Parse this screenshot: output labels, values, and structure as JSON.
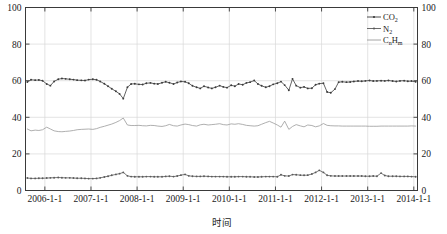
{
  "chart_data": {
    "type": "line",
    "title": "",
    "xlabel": "时间",
    "ylabel": "",
    "ylim": [
      0,
      100
    ],
    "yticks": [
      0,
      20,
      40,
      60,
      80,
      100
    ],
    "ytick_labels": [
      "0",
      "20",
      "40",
      "60",
      "80",
      "100"
    ],
    "right_axis": true,
    "right_ytick_labels": [
      "0",
      "20",
      "40",
      "60",
      "80",
      "100"
    ],
    "grid": true,
    "legend_position": "top-right",
    "xtick_labels": [
      "2006-1-1",
      "2007-1-1",
      "2008-1-1",
      "2009-1-1",
      "2010-1-1",
      "2011-1-1",
      "2012-1-1",
      "2013-1-1",
      "2014-1-1"
    ],
    "xlim": [
      "2005-8-1",
      "2014-2-1"
    ],
    "series": [
      {
        "name": "CO2",
        "label_main": "CO",
        "label_sub": "2",
        "color": "#3b3b3b",
        "marker": "dot",
        "x": [
          2005.62,
          2005.7,
          2005.79,
          2005.87,
          2005.95,
          2006.04,
          2006.12,
          2006.2,
          2006.29,
          2006.37,
          2006.45,
          2006.54,
          2006.62,
          2006.7,
          2006.79,
          2006.87,
          2006.95,
          2007.04,
          2007.12,
          2007.2,
          2007.29,
          2007.37,
          2007.45,
          2007.54,
          2007.62,
          2007.7,
          2007.79,
          2007.87,
          2007.95,
          2008.04,
          2008.12,
          2008.2,
          2008.29,
          2008.37,
          2008.45,
          2008.54,
          2008.62,
          2008.7,
          2008.79,
          2008.87,
          2008.95,
          2009.04,
          2009.12,
          2009.2,
          2009.29,
          2009.37,
          2009.45,
          2009.54,
          2009.62,
          2009.7,
          2009.79,
          2009.87,
          2009.95,
          2010.04,
          2010.12,
          2010.2,
          2010.29,
          2010.37,
          2010.45,
          2010.54,
          2010.62,
          2010.7,
          2010.79,
          2010.87,
          2010.95,
          2011.04,
          2011.12,
          2011.2,
          2011.29,
          2011.37,
          2011.45,
          2011.54,
          2011.62,
          2011.7,
          2011.79,
          2011.87,
          2011.95,
          2012.04,
          2012.12,
          2012.2,
          2012.29,
          2012.37,
          2012.45,
          2012.54,
          2012.62,
          2012.7,
          2012.79,
          2012.87,
          2012.95,
          2013.04,
          2013.12,
          2013.2,
          2013.29,
          2013.37,
          2013.45,
          2013.54,
          2013.62,
          2013.7,
          2013.79,
          2013.87,
          2013.95,
          2014.04
        ],
        "y": [
          59.3,
          60.5,
          60.3,
          60.4,
          60.0,
          58.2,
          57.3,
          59.6,
          60.8,
          61.2,
          61.0,
          60.8,
          60.6,
          60.3,
          60.2,
          60.1,
          60.6,
          60.8,
          60.5,
          59.6,
          58.3,
          57.0,
          55.6,
          54.2,
          52.8,
          50.2,
          56.4,
          58.2,
          58.3,
          58.0,
          57.9,
          58.6,
          58.8,
          58.4,
          58.2,
          58.9,
          59.4,
          58.9,
          58.2,
          59.0,
          59.6,
          59.4,
          58.6,
          57.2,
          56.4,
          55.8,
          57.0,
          56.3,
          55.8,
          56.4,
          57.3,
          56.6,
          56.2,
          57.5,
          57.0,
          58.2,
          57.8,
          58.8,
          59.2,
          60.1,
          58.2,
          57.2,
          56.4,
          57.0,
          58.0,
          58.6,
          59.5,
          57.6,
          54.8,
          61.0,
          57.3,
          56.2,
          56.6,
          55.8,
          55.9,
          57.8,
          58.4,
          58.6,
          53.8,
          53.4,
          55.4,
          59.2,
          59.4,
          59.2,
          59.3,
          59.6,
          59.8,
          59.7,
          59.9,
          60.1,
          59.8,
          59.9,
          60.0,
          59.9,
          60.1,
          59.8,
          59.6,
          59.9,
          60.0,
          59.7,
          59.8,
          59.4
        ]
      },
      {
        "name": "N2",
        "label_main": "N",
        "label_sub": "2",
        "color": "#5a5a5a",
        "marker": "dot",
        "x": [
          2005.62,
          2005.7,
          2005.79,
          2005.87,
          2005.95,
          2006.04,
          2006.12,
          2006.2,
          2006.29,
          2006.37,
          2006.45,
          2006.54,
          2006.62,
          2006.7,
          2006.79,
          2006.87,
          2006.95,
          2007.04,
          2007.12,
          2007.2,
          2007.29,
          2007.37,
          2007.45,
          2007.54,
          2007.62,
          2007.7,
          2007.79,
          2007.87,
          2007.95,
          2008.04,
          2008.12,
          2008.2,
          2008.29,
          2008.37,
          2008.45,
          2008.54,
          2008.62,
          2008.7,
          2008.79,
          2008.87,
          2008.95,
          2009.04,
          2009.12,
          2009.2,
          2009.29,
          2009.37,
          2009.45,
          2009.54,
          2009.62,
          2009.7,
          2009.79,
          2009.87,
          2009.95,
          2010.04,
          2010.12,
          2010.2,
          2010.29,
          2010.37,
          2010.45,
          2010.54,
          2010.62,
          2010.7,
          2010.79,
          2010.87,
          2010.95,
          2011.04,
          2011.12,
          2011.2,
          2011.29,
          2011.37,
          2011.45,
          2011.54,
          2011.62,
          2011.7,
          2011.79,
          2011.87,
          2011.95,
          2012.04,
          2012.12,
          2012.2,
          2012.29,
          2012.37,
          2012.45,
          2012.54,
          2012.62,
          2012.7,
          2012.79,
          2012.87,
          2012.95,
          2013.04,
          2013.12,
          2013.2,
          2013.29,
          2013.37,
          2013.45,
          2013.54,
          2013.62,
          2013.7,
          2013.79,
          2013.87,
          2013.95,
          2014.04
        ],
        "y": [
          6.8,
          6.6,
          6.6,
          6.7,
          6.7,
          6.8,
          6.9,
          7.0,
          7.1,
          7.0,
          6.9,
          6.9,
          6.8,
          6.7,
          6.7,
          6.6,
          6.5,
          6.5,
          6.6,
          6.9,
          7.4,
          7.8,
          8.3,
          8.8,
          9.2,
          9.9,
          8.0,
          7.6,
          7.5,
          7.5,
          7.5,
          7.6,
          7.6,
          7.5,
          7.5,
          7.5,
          7.7,
          7.8,
          7.6,
          7.9,
          8.4,
          8.8,
          8.0,
          7.8,
          7.7,
          7.7,
          7.8,
          7.7,
          7.6,
          7.6,
          7.6,
          7.6,
          7.5,
          7.5,
          7.5,
          7.6,
          7.6,
          7.5,
          7.5,
          7.4,
          7.4,
          7.5,
          7.6,
          7.6,
          7.6,
          7.5,
          8.6,
          8.0,
          7.9,
          8.7,
          8.6,
          8.4,
          8.3,
          8.4,
          9.0,
          9.9,
          11.0,
          9.9,
          8.3,
          8.0,
          7.9,
          7.9,
          7.9,
          7.9,
          7.9,
          7.9,
          7.9,
          7.9,
          7.8,
          7.8,
          7.9,
          7.8,
          9.5,
          8.2,
          7.8,
          7.8,
          7.8,
          7.7,
          7.7,
          7.7,
          7.6,
          7.5
        ]
      },
      {
        "name": "CnHm",
        "label_main": "C",
        "label_sub": "n",
        "label_main2": "H",
        "label_sub2": "m",
        "color": "#9a9a9a",
        "marker": "none",
        "x": [
          2005.62,
          2005.7,
          2005.79,
          2005.87,
          2005.95,
          2006.04,
          2006.12,
          2006.2,
          2006.29,
          2006.37,
          2006.45,
          2006.54,
          2006.62,
          2006.7,
          2006.79,
          2006.87,
          2006.95,
          2007.04,
          2007.12,
          2007.2,
          2007.29,
          2007.37,
          2007.45,
          2007.54,
          2007.62,
          2007.7,
          2007.79,
          2007.87,
          2007.95,
          2008.04,
          2008.12,
          2008.2,
          2008.29,
          2008.37,
          2008.45,
          2008.54,
          2008.62,
          2008.7,
          2008.79,
          2008.87,
          2008.95,
          2009.04,
          2009.12,
          2009.2,
          2009.29,
          2009.37,
          2009.45,
          2009.54,
          2009.62,
          2009.7,
          2009.79,
          2009.87,
          2009.95,
          2010.04,
          2010.12,
          2010.2,
          2010.29,
          2010.37,
          2010.45,
          2010.54,
          2010.62,
          2010.7,
          2010.79,
          2010.87,
          2010.95,
          2011.04,
          2011.12,
          2011.2,
          2011.29,
          2011.37,
          2011.45,
          2011.54,
          2011.62,
          2011.7,
          2011.79,
          2011.87,
          2011.95,
          2012.04,
          2012.12,
          2012.2,
          2012.29,
          2012.37,
          2012.45,
          2012.54,
          2012.62,
          2012.7,
          2012.79,
          2012.87,
          2012.95,
          2013.04,
          2013.12,
          2013.2,
          2013.29,
          2013.37,
          2013.45,
          2013.54,
          2013.62,
          2013.7,
          2013.79,
          2013.87,
          2013.95,
          2014.04
        ],
        "y": [
          33.6,
          32.6,
          33.0,
          32.8,
          33.2,
          34.6,
          33.6,
          32.6,
          32.2,
          32.1,
          32.3,
          32.5,
          32.8,
          33.2,
          33.4,
          33.5,
          33.6,
          33.4,
          33.8,
          34.5,
          35.1,
          35.7,
          36.3,
          37.2,
          38.2,
          39.6,
          35.8,
          35.5,
          35.5,
          35.6,
          35.4,
          35.3,
          35.6,
          35.5,
          35.2,
          35.0,
          35.4,
          36.1,
          35.4,
          35.2,
          35.8,
          36.3,
          36.0,
          35.5,
          35.2,
          35.9,
          36.2,
          35.8,
          36.0,
          36.2,
          36.5,
          36.0,
          35.8,
          36.4,
          36.2,
          36.5,
          36.1,
          35.6,
          35.4,
          35.2,
          35.4,
          36.2,
          37.1,
          37.8,
          36.9,
          35.8,
          34.6,
          37.9,
          33.4,
          35.0,
          36.0,
          35.3,
          34.8,
          35.8,
          35.5,
          34.8,
          35.3,
          36.6,
          35.6,
          35.4,
          35.3,
          35.3,
          35.2,
          35.2,
          35.2,
          35.2,
          35.2,
          35.2,
          35.2,
          35.1,
          35.1,
          35.1,
          35.2,
          35.2,
          35.2,
          35.2,
          35.2,
          35.2,
          35.2,
          35.2,
          35.3,
          35.2
        ]
      }
    ]
  },
  "legend": {
    "entries": [
      {
        "text": "CO",
        "sub": "2",
        "name": "legend-co2"
      },
      {
        "text": "N",
        "sub": "2",
        "name": "legend-n2"
      },
      {
        "text": "C",
        "sub": "n",
        "text2": "H",
        "sub2": "m",
        "name": "legend-cnhm"
      }
    ]
  },
  "axes": {
    "x_title": "时间",
    "left_labels": [
      "100",
      "80",
      "60",
      "40",
      "20",
      "0"
    ],
    "right_labels": [
      "100",
      "80",
      "60",
      "40",
      "20",
      "0"
    ],
    "x_labels": [
      "2006-1-1",
      "2007-1-1",
      "2008-1-1",
      "2009-1-1",
      "2010-1-1",
      "2011-1-1",
      "2012-1-1",
      "2013-1-1",
      "2014-1-1"
    ]
  },
  "colors": {
    "co2": "#3b3b3b",
    "n2": "#5a5a5a",
    "cnhm": "#9a9a9a",
    "axis": "#3a3a3a",
    "grid": "#d9d9d9",
    "background": "#ffffff"
  }
}
